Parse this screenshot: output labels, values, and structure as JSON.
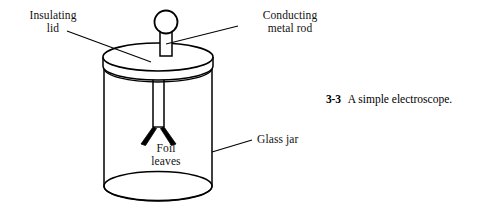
{
  "figure": {
    "caption": {
      "number": "3-3",
      "text": "A simple electroscope."
    },
    "labels": {
      "insulating_lid": "Insulating\nlid",
      "conducting_metal_rod": "Conducting\nmetal rod",
      "foil_leaves": "Foil\nleaves",
      "glass_jar": "Glass jar"
    },
    "parts": [
      {
        "name": "terminal-knob",
        "shape": "circle"
      },
      {
        "name": "conducting-metal-rod",
        "shape": "rod"
      },
      {
        "name": "insulating-lid",
        "shape": "disc"
      },
      {
        "name": "glass-jar",
        "shape": "cylinder"
      },
      {
        "name": "foil-leaves",
        "shape": "v-pair"
      }
    ],
    "colors": {
      "ink": "#000000",
      "background": "#ffffff",
      "fill": "#ffffff"
    }
  }
}
